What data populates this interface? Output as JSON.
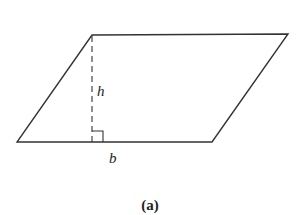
{
  "figure": {
    "caption": "(a)",
    "shape": "parallelogram",
    "labels": {
      "height": "h",
      "base": "b"
    },
    "vertices": {
      "top_left": [
        92,
        35
      ],
      "top_right": [
        288,
        34
      ],
      "bottom_right": [
        212,
        142
      ],
      "bottom_left": [
        17,
        142
      ]
    },
    "height_line": {
      "x": 92,
      "y_top": 35,
      "y_bottom": 142,
      "style": "dashed"
    },
    "right_angle_marker": {
      "x": 92,
      "y": 131,
      "size": 11
    },
    "stroke_color": "#333333"
  }
}
